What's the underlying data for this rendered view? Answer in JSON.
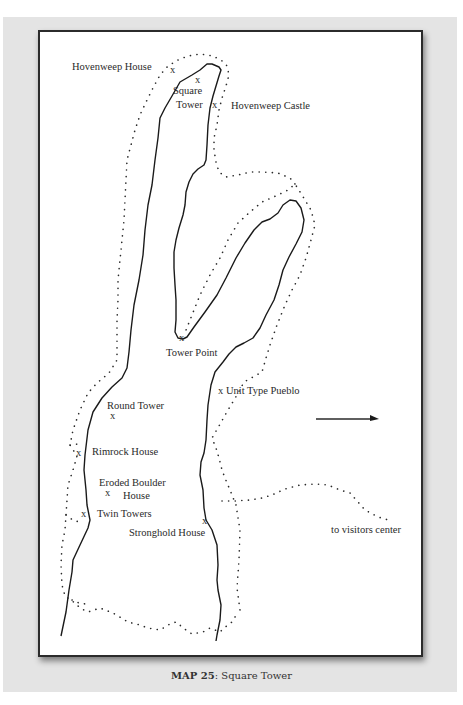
{
  "map": {
    "labels": [
      {
        "id": "hovenweep-house",
        "text": "Hovenweep House",
        "x": 72,
        "y": 61
      },
      {
        "id": "square-tower-1",
        "text": "Square",
        "x": 173,
        "y": 85
      },
      {
        "id": "square-tower-2",
        "text": "Tower",
        "x": 176,
        "y": 99
      },
      {
        "id": "hovenweep-castle",
        "text": "Hovenweep Castle",
        "x": 231,
        "y": 99
      },
      {
        "id": "tower-point",
        "text": "Tower Point",
        "x": 166,
        "y": 347
      },
      {
        "id": "unit-type-pueblo",
        "text": "x Unit Type Pueblo",
        "x": 218,
        "y": 385
      },
      {
        "id": "round-tower",
        "text": "Round Tower",
        "x": 107,
        "y": 400
      },
      {
        "id": "rimrock-house",
        "text": "Rimrock House",
        "x": 92,
        "y": 446
      },
      {
        "id": "eroded-boulder-1",
        "text": "Eroded Boulder",
        "x": 99,
        "y": 477
      },
      {
        "id": "eroded-boulder-2",
        "text": "House",
        "x": 123,
        "y": 490
      },
      {
        "id": "twin-towers",
        "text": "Twin Towers",
        "x": 97,
        "y": 508
      },
      {
        "id": "stronghold-house",
        "text": "Stronghold House",
        "x": 129,
        "y": 527
      },
      {
        "id": "to-visitors-center",
        "text": "to visitors center",
        "x": 331,
        "y": 524
      }
    ],
    "markers": [
      {
        "id": "x-hovenweep-house",
        "text": "x",
        "x": 170,
        "y": 66
      },
      {
        "id": "x-square-tower",
        "text": "x",
        "x": 195,
        "y": 76
      },
      {
        "id": "x-hovenweep-castle",
        "text": "x",
        "x": 212,
        "y": 99
      },
      {
        "id": "x-tower-point",
        "text": "x",
        "x": 179,
        "y": 334
      },
      {
        "id": "x-round-tower",
        "text": "x",
        "x": 110,
        "y": 411
      },
      {
        "id": "x-rimrock-house",
        "text": "x",
        "x": 76,
        "y": 447
      },
      {
        "id": "x-eroded-boulder",
        "text": "x",
        "x": 105,
        "y": 489
      },
      {
        "id": "x-twin-towers",
        "text": "x",
        "x": 81,
        "y": 508
      },
      {
        "id": "x-stronghold-house",
        "text": "x",
        "x": 202,
        "y": 516
      }
    ],
    "direction_arrow": {
      "x1": 316,
      "y1": 419,
      "x2": 378,
      "y2": 419
    }
  },
  "caption": {
    "bold": "MAP 25",
    "rest": ": Square Tower"
  }
}
